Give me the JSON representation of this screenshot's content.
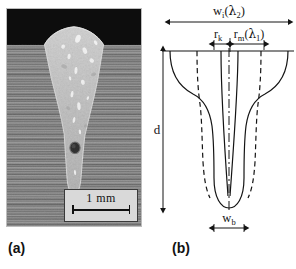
{
  "figure": {
    "panels": [
      {
        "id": "a",
        "caption": "(a)",
        "type": "micrograph",
        "description": "laser weld cross-section macrograph",
        "scale_bar": {
          "label": "1 mm"
        }
      },
      {
        "id": "b",
        "caption": "(b)",
        "type": "schematic",
        "description": "weld pool and keyhole geometry schematic"
      }
    ]
  },
  "schematic": {
    "labels": {
      "width_top": {
        "symbol": "w",
        "sub": "i",
        "arg_open": "(",
        "arg_symbol": "λ",
        "arg_sub": "2",
        "arg_close": ")"
      },
      "keyhole_radius": {
        "symbol": "r",
        "sub": "k"
      },
      "melt_radius": {
        "symbol": "r",
        "sub": "m",
        "arg_open": "(",
        "arg_symbol": "λ",
        "arg_sub": "1",
        "arg_close": ")"
      },
      "depth": {
        "symbol": "d"
      },
      "width_bottom": {
        "symbol": "w",
        "sub": "b"
      }
    }
  },
  "colors": {
    "line": "#141414",
    "background": "#ffffff",
    "micrograph_base": "#8a8a8a",
    "micrograph_top": "#0d0d0d",
    "fusion_zone": "#c9c9c9",
    "scalebar_box": "#d9d9d9"
  }
}
